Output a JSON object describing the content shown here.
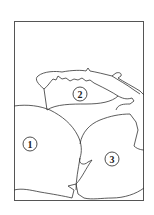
{
  "diagram": {
    "type": "line-drawing",
    "stroke_color": "#333333",
    "background": "#ffffff",
    "regions": [
      {
        "id": "1",
        "label": "1",
        "description": "large rounded object lower-left",
        "cx": 30,
        "cy": 144
      },
      {
        "id": "2",
        "label": "2",
        "description": "open bowl/container top-center",
        "cx": 80,
        "cy": 94
      },
      {
        "id": "3",
        "label": "3",
        "description": "rounded object lower-right",
        "cx": 112,
        "cy": 159
      }
    ]
  }
}
